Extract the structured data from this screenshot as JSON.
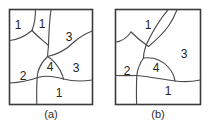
{
  "figure": {
    "type": "two-panel-diagram",
    "background_color": "#ffffff",
    "line_color": "#4a4a4a",
    "text_color": "#232323"
  },
  "panels": [
    {
      "id": "a",
      "caption": "(a)",
      "box": {
        "x": 9,
        "y": 9,
        "width": 84,
        "height": 96
      },
      "regions": [
        {
          "name": "region-top-left",
          "label": "1",
          "x": 22,
          "y": 24
        },
        {
          "name": "region-top-center",
          "label": "1",
          "x": 44,
          "y": 23
        },
        {
          "name": "region-upper-right",
          "label": "3",
          "x": 70,
          "y": 36
        },
        {
          "name": "region-center",
          "label": "4",
          "x": 50,
          "y": 66
        },
        {
          "name": "region-mid-right",
          "label": "3",
          "x": 74,
          "y": 70
        },
        {
          "name": "region-left",
          "label": "2",
          "x": 24,
          "y": 76
        },
        {
          "name": "region-bottom",
          "label": "1",
          "x": 58,
          "y": 93
        }
      ]
    },
    {
      "id": "b",
      "caption": "(b)",
      "box": {
        "x": 115,
        "y": 9,
        "width": 86,
        "height": 96
      },
      "regions": [
        {
          "name": "region-top",
          "label": "1",
          "x": 147,
          "y": 24
        },
        {
          "name": "region-right",
          "label": "3",
          "x": 184,
          "y": 54
        },
        {
          "name": "region-center",
          "label": "4",
          "x": 161,
          "y": 70
        },
        {
          "name": "region-left",
          "label": "2",
          "x": 132,
          "y": 76
        },
        {
          "name": "region-bottom",
          "label": "1",
          "x": 170,
          "y": 93
        }
      ]
    }
  ]
}
